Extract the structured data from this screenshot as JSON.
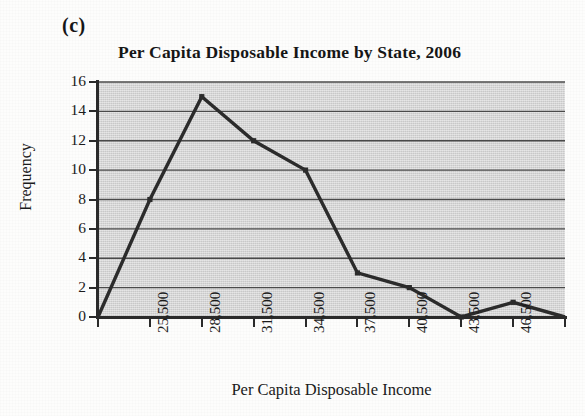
{
  "figure": {
    "part_label": "(c)"
  },
  "chart_data": {
    "type": "line",
    "title": "Per Capita Disposable Income by State, 2006",
    "xlabel": "Per Capita Disposable Income",
    "ylabel": "Frequency",
    "ylim": [
      0,
      16
    ],
    "y_ticks": [
      0,
      2,
      4,
      6,
      8,
      10,
      12,
      14,
      16
    ],
    "y_tick_labels": [
      "0",
      "2",
      "4",
      "6",
      "8",
      "10",
      "12",
      "14",
      "16"
    ],
    "grid": "horizontal",
    "legend": "none",
    "x_tick_labels": [
      "",
      "25,500",
      "28,500",
      "31,500",
      "34,500",
      "37,500",
      "40,500",
      "43,500",
      "46,500",
      ""
    ],
    "categories": [
      "22,500",
      "25,500",
      "28,500",
      "31,500",
      "34,500",
      "37,500",
      "40,500",
      "43,500",
      "46,500",
      "49,500"
    ],
    "values": [
      0,
      8,
      15,
      12,
      10,
      3,
      2,
      0,
      1,
      0
    ],
    "marker": "square",
    "line_color": "#2b2b2b",
    "plot_background": "#d2d2d2"
  }
}
